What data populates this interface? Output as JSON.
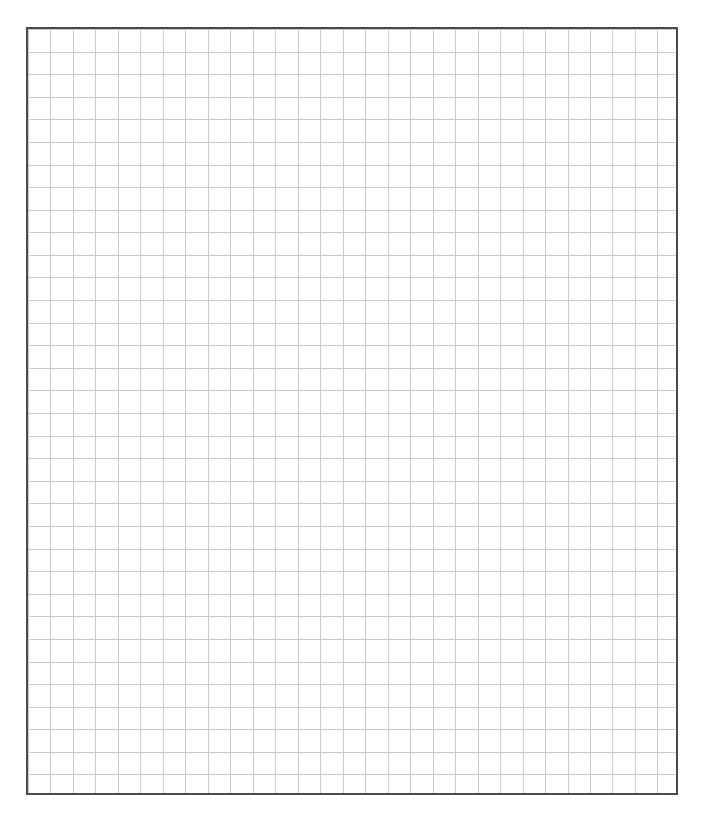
{
  "page": {
    "width": 704,
    "height": 823,
    "background_color": "#ffffff",
    "content_description": "blank square-ruled graph paper sheet"
  },
  "grid_sheet": {
    "name": "graph-paper-sheet",
    "left": 26,
    "top": 27,
    "width": 652,
    "height": 768,
    "fill_color": "#ffffff",
    "border_color": "#4a4a4a",
    "border_width": 2,
    "columns": 29,
    "rows": 34,
    "cell_width": 22.48,
    "cell_height": 22.59,
    "rule_color": "#c9c9c9",
    "rule_width": 1
  },
  "chart_data": {
    "type": "table",
    "title": "",
    "subtitle": "",
    "xlabel": "",
    "ylabel": "",
    "grid": true,
    "legend": "none",
    "annotations": [],
    "categories": [],
    "values": [],
    "series": [],
    "note": "Empty square-ruled grid: 29 columns by 34 rows, no plotted data, no labels, no tick text."
  }
}
